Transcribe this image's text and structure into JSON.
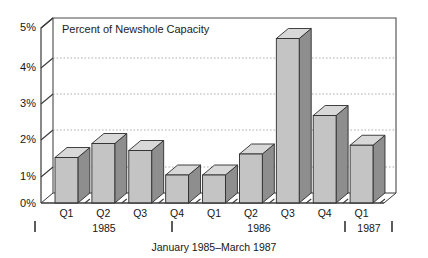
{
  "chart_data": {
    "type": "bar",
    "title": "Percent of Newshole Capacity",
    "xlabel": "January 1985–March 1987",
    "ylabel": "",
    "categories": [
      "Q1",
      "Q2",
      "Q3",
      "Q4",
      "Q1",
      "Q2",
      "Q3",
      "Q4",
      "Q1"
    ],
    "group_labels": [
      "1985",
      "1986",
      "1987"
    ],
    "values": [
      1.3,
      1.7,
      1.5,
      0.8,
      0.8,
      1.4,
      4.7,
      2.5,
      1.65
    ],
    "ylim": [
      0,
      5
    ],
    "ytick_values": [
      0,
      1,
      2,
      3,
      4,
      5
    ],
    "ytick_labels": [
      "0%",
      "1%",
      "2%",
      "3%",
      "4%",
      "5%"
    ],
    "grid": true,
    "legend": "none",
    "style": "3d-bar"
  },
  "chart": {
    "title": "Percent of Newshole Capacity",
    "axis_title": "January 1985–March 1987",
    "y_ticks": [
      {
        "label": "5%",
        "value": 5
      },
      {
        "label": "4%",
        "value": 4
      },
      {
        "label": "3%",
        "value": 3
      },
      {
        "label": "2%",
        "value": 2
      },
      {
        "label": "1%",
        "value": 1
      },
      {
        "label": "0%",
        "value": 0
      }
    ],
    "bars": [
      {
        "label": "Q1",
        "value": 1.3,
        "year": "1985"
      },
      {
        "label": "Q2",
        "value": 1.7,
        "year": "1985"
      },
      {
        "label": "Q3",
        "value": 1.5,
        "year": "1985"
      },
      {
        "label": "Q4",
        "value": 0.8,
        "year": "1985"
      },
      {
        "label": "Q1",
        "value": 0.8,
        "year": "1986"
      },
      {
        "label": "Q2",
        "value": 1.4,
        "year": "1986"
      },
      {
        "label": "Q3",
        "value": 4.7,
        "year": "1986"
      },
      {
        "label": "Q4",
        "value": 2.5,
        "year": "1986"
      },
      {
        "label": "Q1",
        "value": 1.65,
        "year": "1987"
      }
    ],
    "year_groups": [
      {
        "label": "1985"
      },
      {
        "label": "1986"
      },
      {
        "label": "1987"
      }
    ],
    "colors": {
      "bar_front": "#c4c4c4",
      "bar_side": "#8e8e8e",
      "bar_top": "#d8d8d8",
      "grid": "#9a9a9a",
      "axis": "#3a3a3a",
      "text": "#161616",
      "background": "#ffffff"
    }
  }
}
